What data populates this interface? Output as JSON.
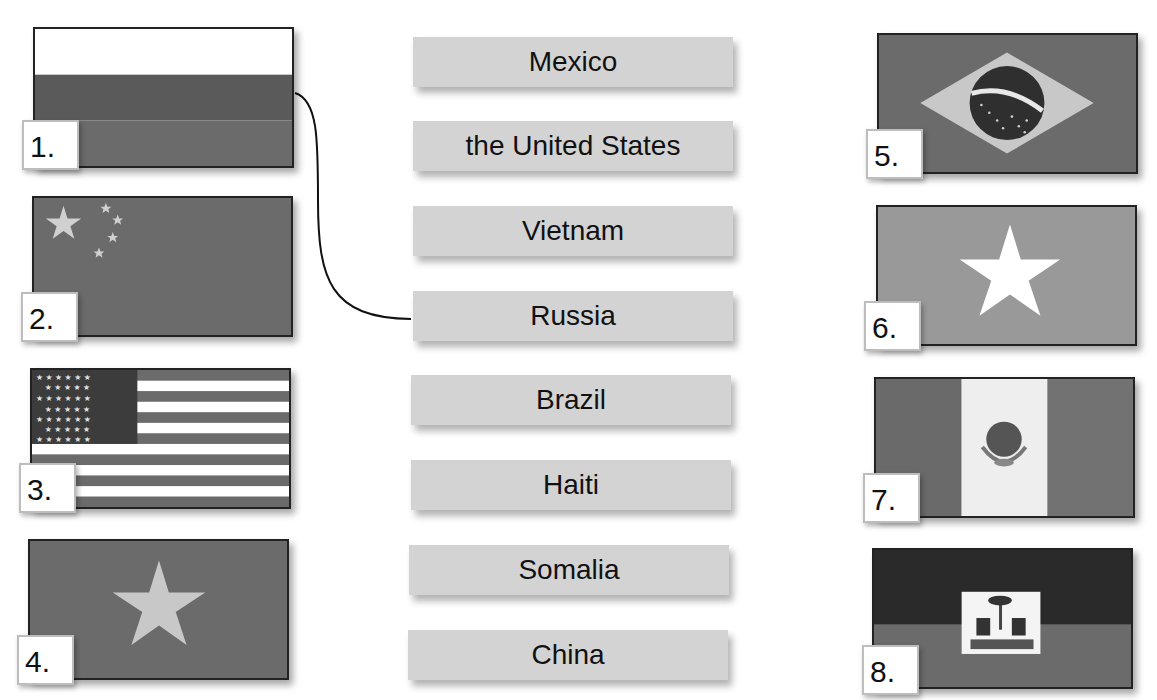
{
  "exercise": {
    "labels": [
      {
        "text": "Mexico"
      },
      {
        "text": "the United States"
      },
      {
        "text": "Vietnam"
      },
      {
        "text": "Russia"
      },
      {
        "text": "Brazil"
      },
      {
        "text": "Haiti"
      },
      {
        "text": "Somalia"
      },
      {
        "text": "China"
      }
    ],
    "flags": [
      {
        "number": "1.",
        "country": "russia"
      },
      {
        "number": "2.",
        "country": "china"
      },
      {
        "number": "3.",
        "country": "united-states"
      },
      {
        "number": "4.",
        "country": "vietnam"
      },
      {
        "number": "5.",
        "country": "brazil"
      },
      {
        "number": "6.",
        "country": "somalia"
      },
      {
        "number": "7.",
        "country": "mexico"
      },
      {
        "number": "8.",
        "country": "haiti"
      }
    ],
    "example_match": {
      "flag": "1.",
      "label": "Russia"
    },
    "colors": {
      "label_bg": "#d3d3d3",
      "flag_dark": "#5a5a5a",
      "flag_mid": "#6b6b6b",
      "flag_light": "#c8c8c8"
    }
  }
}
